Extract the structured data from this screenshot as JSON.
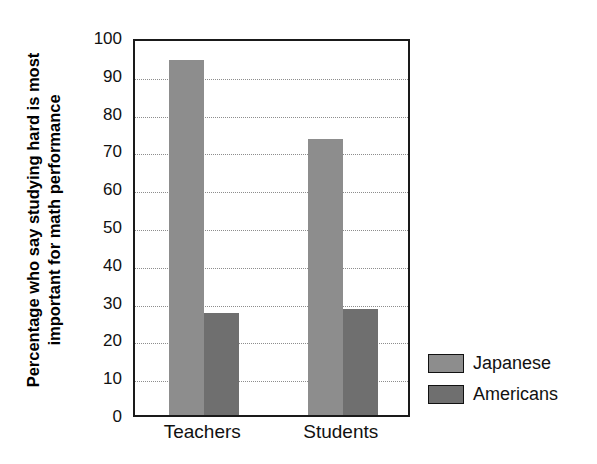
{
  "chart_data": {
    "type": "bar",
    "title": "",
    "xlabel": "",
    "ylabel": "Percentage who say studying hard is most important for math performance",
    "ylabel_lines": [
      "Percentage who say studying hard is most",
      "important for math performance"
    ],
    "categories": [
      "Teachers",
      "Students"
    ],
    "series": [
      {
        "name": "Japanese",
        "values": [
          94,
          73
        ],
        "color": "#8d8d8d"
      },
      {
        "name": "Americans",
        "values": [
          27,
          28
        ],
        "color": "#6f6f6f"
      }
    ],
    "ylim": [
      0,
      100
    ],
    "ytick_values": [
      0,
      10,
      20,
      30,
      40,
      50,
      60,
      70,
      80,
      90,
      100
    ],
    "ytick_labels": [
      "0",
      "10",
      "20",
      "30",
      "40",
      "50",
      "60",
      "70",
      "80",
      "90",
      "100"
    ],
    "grid": true,
    "grid_axis": "y",
    "grid_style": "dotted",
    "legend": [
      "Japanese",
      "Americans"
    ],
    "legend_position": "right-bottom",
    "frame_color": "#1a1a1a",
    "background": "#ffffff"
  }
}
